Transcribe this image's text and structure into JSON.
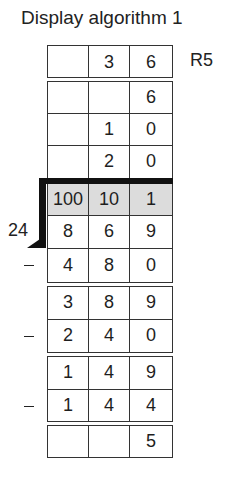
{
  "title": "Display algorithm 1",
  "register_label": "R5",
  "divisor_label": "24",
  "operator_symbol": "−",
  "header_row": [
    "100",
    "10",
    "1"
  ],
  "quotient_rows": [
    [
      "",
      "3",
      "6"
    ],
    [
      "",
      "",
      "6"
    ],
    [
      "",
      "1",
      "0"
    ],
    [
      "",
      "2",
      "0"
    ]
  ],
  "work_rows": [
    {
      "op": "",
      "cells": [
        "8",
        "6",
        "9"
      ]
    },
    {
      "op": "−",
      "cells": [
        "4",
        "8",
        "0"
      ]
    },
    {
      "op": "",
      "cells": [
        "3",
        "8",
        "9"
      ]
    },
    {
      "op": "−",
      "cells": [
        "2",
        "4",
        "0"
      ]
    },
    {
      "op": "",
      "cells": [
        "1",
        "4",
        "9"
      ]
    },
    {
      "op": "−",
      "cells": [
        "1",
        "4",
        "4"
      ]
    },
    {
      "op": "",
      "cells": [
        "",
        "",
        "5"
      ]
    }
  ],
  "colors": {
    "header_fill": "#dcdcdc",
    "bracket": "#111111",
    "lines": "#333333"
  }
}
